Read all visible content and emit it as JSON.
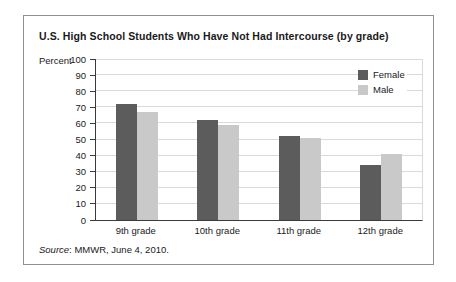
{
  "figure": {
    "title": "U.S. High School Students Who Have Not Had Intercourse (by grade)",
    "y_axis_unit_label": "Percent",
    "source_prefix": "Source",
    "source_rest": ": MMWR, June 4, 2010."
  },
  "colors": {
    "female_bar": "#5c5c5c",
    "male_bar": "#c9c9c9",
    "gridline": "#d9d9d9",
    "axis": "#3a3a3a",
    "box_border": "#8f8f8f",
    "text": "#1a1a1a",
    "background": "#ffffff"
  },
  "chart_data": {
    "type": "bar",
    "title": "U.S. High School Students Who Have Not Had Intercourse (by grade)",
    "categories": [
      "9th grade",
      "10th grade",
      "11th grade",
      "12th grade"
    ],
    "series": [
      {
        "name": "Female",
        "color": "#5c5c5c",
        "values": [
          72,
          62,
          52,
          34
        ]
      },
      {
        "name": "Male",
        "color": "#c9c9c9",
        "values": [
          67,
          59,
          51,
          41
        ]
      }
    ],
    "xlabel": "",
    "ylabel": "Percent",
    "ylim": [
      0,
      100
    ],
    "yticks": [
      0,
      10,
      20,
      30,
      40,
      50,
      60,
      70,
      80,
      90,
      100
    ],
    "grid": true,
    "legend": {
      "position": "top-right-inside",
      "entries": [
        "Female",
        "Male"
      ]
    },
    "source": "Source: MMWR, June 4, 2010."
  }
}
